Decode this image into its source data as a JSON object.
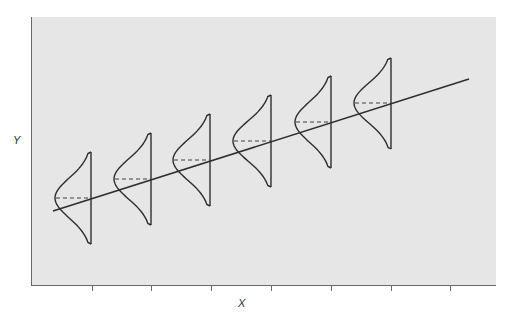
{
  "figure": {
    "x_axis_label": "X",
    "y_axis_label": "Y",
    "colors": {
      "plot_background": "#e6e6e6",
      "page_background": "#ffffff",
      "line": "#2e2e2e",
      "axis": "#6a6a6a",
      "label": "#333333"
    }
  },
  "plot_area": {
    "x": 31,
    "y": 17,
    "width": 465,
    "height": 268
  },
  "x_ticks": [
    92,
    151,
    211,
    271,
    331,
    391,
    450
  ],
  "regression_line": {
    "x1": 53,
    "y1": 211,
    "x2": 469,
    "y2": 79
  },
  "conditional_distributions": [
    {
      "index": 1,
      "base_x": 91,
      "top_y": 152,
      "bottom_y": 244,
      "mean_y": 198,
      "peak_x": 55
    },
    {
      "index": 2,
      "base_x": 151,
      "top_y": 133,
      "bottom_y": 225,
      "mean_y": 179,
      "peak_x": 114
    },
    {
      "index": 3,
      "base_x": 210,
      "top_y": 114,
      "bottom_y": 206,
      "mean_y": 160,
      "peak_x": 173
    },
    {
      "index": 4,
      "base_x": 271,
      "top_y": 95,
      "bottom_y": 187,
      "mean_y": 141,
      "peak_x": 233
    },
    {
      "index": 5,
      "base_x": 331,
      "top_y": 76,
      "bottom_y": 168,
      "mean_y": 122,
      "peak_x": 295
    },
    {
      "index": 6,
      "base_x": 391,
      "top_y": 58,
      "bottom_y": 149,
      "mean_y": 103,
      "peak_x": 354
    }
  ]
}
